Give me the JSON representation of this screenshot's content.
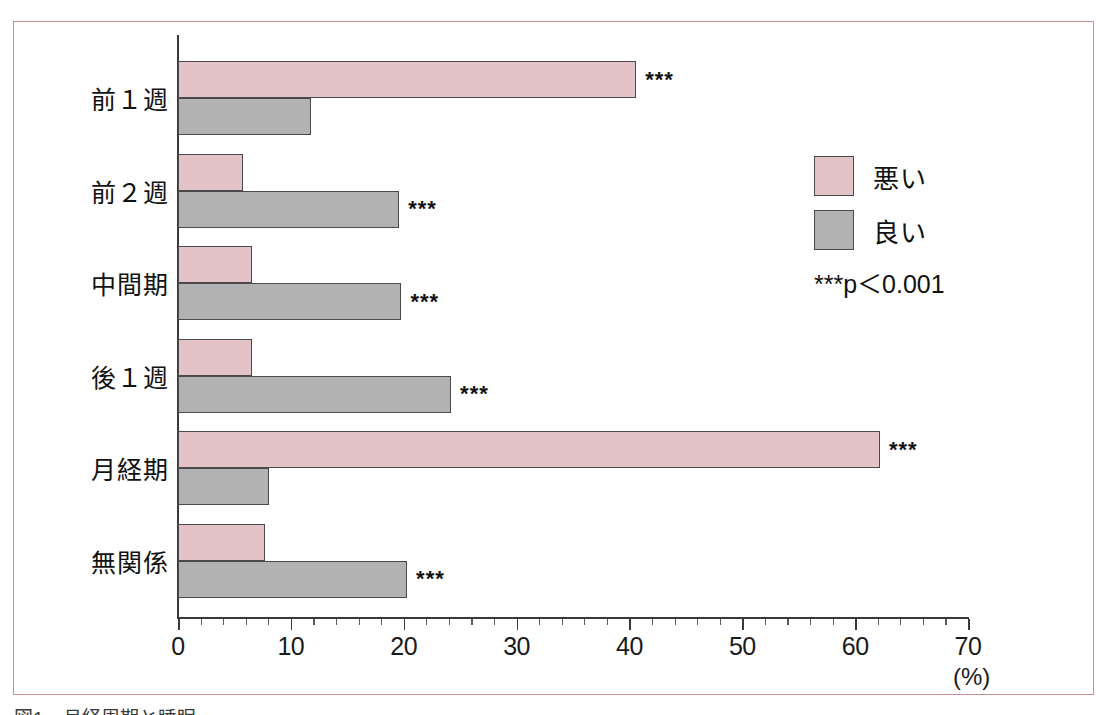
{
  "chart_data": {
    "type": "bar",
    "orientation": "horizontal",
    "title": "",
    "xlabel": "(%)",
    "ylabel": "",
    "xlim": [
      0,
      70
    ],
    "xticks": [
      0,
      10,
      20,
      30,
      40,
      50,
      60,
      70
    ],
    "xtick_labels": [
      "0",
      "10",
      "20",
      "30",
      "40",
      "50",
      "60",
      "70"
    ],
    "minor_tick_step": 2,
    "grid": false,
    "legend_position": "right-top",
    "categories": [
      "前１週",
      "前２週",
      "中間期",
      "後１週",
      "月経期",
      "無関係"
    ],
    "series": [
      {
        "name": "悪い",
        "color": "#e4c3c8",
        "values": [
          40.6,
          5.8,
          6.6,
          6.6,
          62.2,
          7.7
        ],
        "annotations": [
          "***",
          "",
          "",
          "",
          "***",
          ""
        ]
      },
      {
        "name": "良い",
        "color": "#b2b2b2",
        "values": [
          11.8,
          19.6,
          19.8,
          24.2,
          8.1,
          20.3
        ],
        "annotations": [
          "",
          "***",
          "***",
          "***",
          "",
          "***"
        ]
      }
    ],
    "significance_note": "***p＜0.001"
  },
  "legend": {
    "items": [
      {
        "label": "悪い",
        "swatch_class": "bad"
      },
      {
        "label": "良い",
        "swatch_class": "good"
      }
    ],
    "pvalue_note": "***p＜0.001"
  },
  "axis": {
    "unit_label": "(%)"
  },
  "caption": {
    "text": "図1　月経周期と睡眠"
  },
  "colors": {
    "bad": "#e4c3c8",
    "good": "#b2b2b2",
    "frame": "#c98f8f",
    "axis": "#3a3a3a",
    "bar_outline": "#4a4a4a"
  }
}
